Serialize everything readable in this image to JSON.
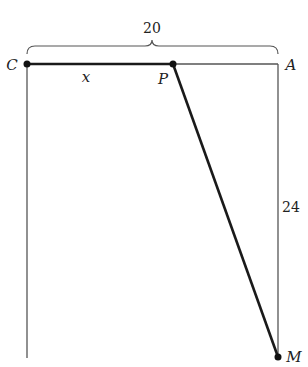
{
  "diagram": {
    "points": {
      "C": {
        "label": "C",
        "x": 27,
        "y": 64
      },
      "P": {
        "label": "P",
        "x": 173,
        "y": 64
      },
      "A": {
        "label": "A",
        "x": 278,
        "y": 64
      },
      "M": {
        "label": "M",
        "x": 278,
        "y": 357
      }
    },
    "measurements": {
      "top_width": "20",
      "right_height": "24",
      "segment_CP": "x"
    },
    "colors": {
      "thick_line": "#1a1a1a",
      "thin_line": "#555555",
      "background": "#ffffff"
    }
  }
}
